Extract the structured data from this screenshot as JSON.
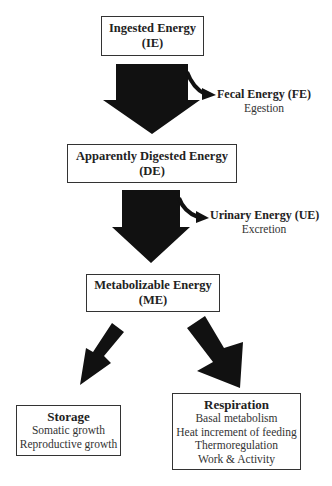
{
  "nodes": {
    "ie": {
      "title": "Ingested Energy",
      "abbr": "(IE)"
    },
    "de": {
      "title": "Apparently Digested Energy",
      "abbr": "(DE)"
    },
    "me": {
      "title": "Metabolizable Energy",
      "abbr": "(ME)"
    },
    "storage": {
      "title": "Storage",
      "items": [
        "Somatic growth",
        "Reproductive growth"
      ]
    },
    "respiration": {
      "title": "Respiration",
      "items": [
        "Basal metabolism",
        "Heat increment of feeding",
        "Thermoregulation",
        "Work & Activity"
      ]
    }
  },
  "losses": {
    "fecal": {
      "title": "Fecal Energy (FE)",
      "process": "Egestion"
    },
    "urinary": {
      "title": "Urinary Energy (UE)",
      "process": "Excretion"
    }
  },
  "colors": {
    "arrow": "#111111",
    "border": "#333333",
    "background": "#ffffff"
  }
}
